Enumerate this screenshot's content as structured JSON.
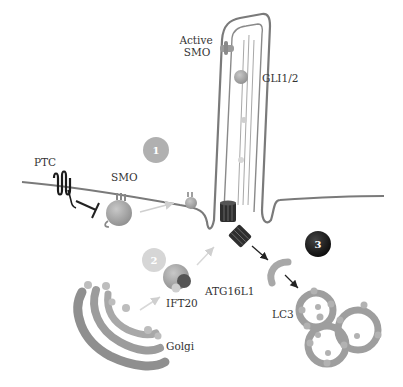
{
  "diagram": {
    "labels": {
      "active_smo": [
        "Active",
        "SMO"
      ],
      "gli": "GLI1/2",
      "ptc": "PTC",
      "smo": "SMO",
      "atg16l1": "ATG16L1",
      "ift20": "IFT20",
      "golgi": "Golgi",
      "lc3": "LC3"
    },
    "steps": [
      {
        "number": "1",
        "fill": "#b0b0b0",
        "text_color": "#ffffff"
      },
      {
        "number": "2",
        "fill": "#d6d6d6",
        "text_color": "#ffffff"
      },
      {
        "number": "3",
        "fill": "#1a1a1a",
        "text_color": "#ffffff"
      }
    ],
    "colors": {
      "membrane": "#777777",
      "protein": "#a6a6a6",
      "dark": "#222222",
      "arrow_light": "#cccccc"
    }
  }
}
